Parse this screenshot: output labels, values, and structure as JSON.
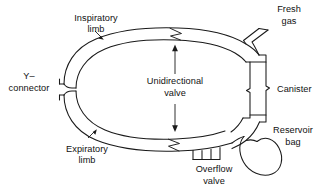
{
  "figure": {
    "background_color": "#ffffff",
    "line_color": "#1a1a1a",
    "text_color": "#111111",
    "width": 326,
    "height": 188
  },
  "labels": {
    "inspiratory_limb_line1": "Inspiratory",
    "inspiratory_limb_line2": "limb",
    "expiratory_limb_line1": "Expiratory",
    "expiratory_limb_line2": "limb",
    "y_connector_line1": "Y–",
    "y_connector_line2": "connector",
    "unidirectional_valve_line1": "Unidirectional",
    "unidirectional_valve_line2": "valve",
    "fresh_gas_line1": "Fresh",
    "fresh_gas_line2": "gas",
    "canister": "Canister",
    "reservoir_bag_line1": "Reservoir",
    "reservoir_bag_line2": "bag",
    "overflow_valve_line1": "Overflow",
    "overflow_valve_line2": "valve"
  },
  "components": [
    {
      "name": "breathing-circuit-ring",
      "shape": "oval-tube"
    },
    {
      "name": "y-connector-opening",
      "shape": "tube-ends"
    },
    {
      "name": "unidirectional-valve-top",
      "shape": "zigzag"
    },
    {
      "name": "unidirectional-valve-bottom",
      "shape": "zigzag"
    },
    {
      "name": "fresh-gas-inlet",
      "shape": "branch-line"
    },
    {
      "name": "co2-absorber-canister",
      "shape": "rectangle"
    },
    {
      "name": "reservoir-bag",
      "shape": "teardrop"
    },
    {
      "name": "overflow-valve",
      "shape": "bracket"
    }
  ]
}
